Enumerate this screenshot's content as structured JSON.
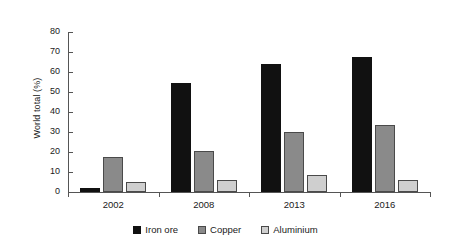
{
  "chart_data": {
    "type": "bar",
    "title": "",
    "subtitle": "",
    "xlabel": "",
    "ylabel": "World total (%)",
    "categories": [
      "2002",
      "2008",
      "2013",
      "2016"
    ],
    "series": [
      {
        "name": "Iron ore",
        "color": "#111111",
        "values": [
          2.0,
          54.5,
          64.0,
          67.5
        ]
      },
      {
        "name": "Copper",
        "color": "#8a8a8a",
        "values": [
          17.5,
          20.3,
          30.2,
          33.5
        ]
      },
      {
        "name": "Aluminium",
        "color": "#cfcfcf",
        "values": [
          5.0,
          6.2,
          8.6,
          6.0
        ]
      }
    ],
    "ylim": [
      0,
      80
    ],
    "ytick_step": 10,
    "yticks": [
      0,
      10,
      20,
      30,
      40,
      50,
      60,
      70,
      80
    ],
    "ytick_labels": [
      "0",
      "10",
      "20",
      "30",
      "40",
      "50",
      "60",
      "70",
      "80"
    ],
    "grid": false,
    "legend_position": "bottom",
    "annotations": []
  }
}
